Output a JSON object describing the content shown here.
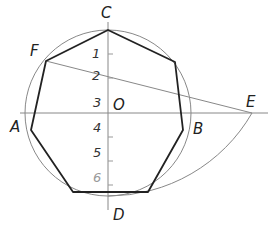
{
  "diagram": {
    "center": {
      "label": "O",
      "x": 108,
      "y": 113
    },
    "radius": 83,
    "points": [
      {
        "id": "C",
        "label": "C",
        "x": 108,
        "y": 30
      },
      {
        "id": "D",
        "label": "D",
        "x": 108,
        "y": 196
      },
      {
        "id": "A",
        "label": "A",
        "x": 25,
        "y": 113
      },
      {
        "id": "B",
        "label": "B",
        "x": 191,
        "y": 113
      },
      {
        "id": "E",
        "label": "E",
        "x": 252,
        "y": 113
      },
      {
        "id": "F",
        "label": "F",
        "x": 46,
        "y": 61
      }
    ],
    "divisions": [
      "1",
      "2",
      "3",
      "4",
      "5",
      "6"
    ],
    "heptagon_vertices": [
      [
        108,
        30
      ],
      [
        175,
        62
      ],
      [
        183,
        130
      ],
      [
        148,
        192
      ],
      [
        73,
        192
      ],
      [
        31,
        130
      ],
      [
        46,
        61
      ]
    ],
    "colors": {
      "polygon": "#222222",
      "construction": "#777777",
      "circle": "#888888"
    }
  },
  "labels": {
    "C": "C",
    "D": "D",
    "A": "A",
    "B": "B",
    "E": "E",
    "F": "F",
    "O": "O",
    "n1": "1",
    "n2": "2",
    "n3": "3",
    "n4": "4",
    "n5": "5",
    "n6": "6"
  }
}
